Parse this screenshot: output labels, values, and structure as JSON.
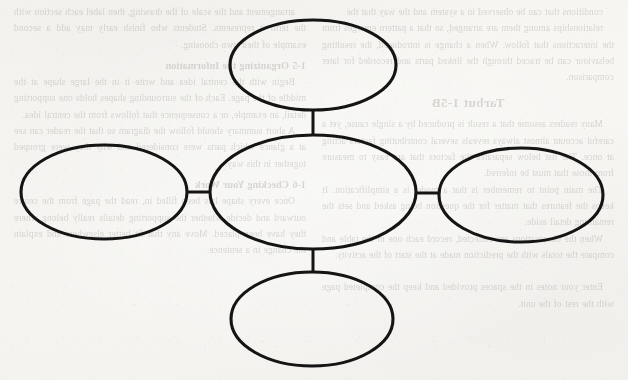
{
  "document": {
    "kind": "worksheet-scan",
    "organizer_type": "bubble-map",
    "page_background": "#f7f6f3",
    "ink_color": "#141414"
  },
  "organizer": {
    "name": "bubble-map-graphic-organizer",
    "center": {
      "id": "center-bubble",
      "label": "",
      "cx": 313,
      "cy": 192,
      "rx": 103,
      "ry": 57
    },
    "satellites": [
      {
        "id": "top-bubble",
        "position": "top",
        "label": "",
        "cx": 313,
        "cy": 65,
        "rx": 83,
        "ry": 45
      },
      {
        "id": "left-bubble",
        "position": "left",
        "label": "",
        "cx": 104,
        "cy": 192,
        "rx": 83,
        "ry": 47
      },
      {
        "id": "right-bubble",
        "position": "right",
        "label": "",
        "cx": 521,
        "cy": 195,
        "rx": 82,
        "ry": 47
      },
      {
        "id": "bottom-bubble",
        "position": "bottom",
        "label": "",
        "cx": 312,
        "cy": 319,
        "rx": 81,
        "ry": 47
      }
    ],
    "connectors": [
      {
        "id": "connector-top",
        "from": "center-bubble",
        "to": "top-bubble",
        "x1": 313,
        "y1": 135,
        "x2": 313,
        "y2": 110
      },
      {
        "id": "connector-left",
        "from": "center-bubble",
        "to": "left-bubble",
        "x1": 210,
        "y1": 192,
        "x2": 187,
        "y2": 192
      },
      {
        "id": "connector-right",
        "from": "center-bubble",
        "to": "right-bubble",
        "x1": 416,
        "y1": 193,
        "x2": 439,
        "y2": 193
      },
      {
        "id": "connector-bottom",
        "from": "center-bubble",
        "to": "bottom-bubble",
        "x1": 313,
        "y1": 249,
        "x2": 313,
        "y2": 272
      }
    ]
  },
  "bleed_through": {
    "note": "faint mirrored text showing through from the reverse side of the page",
    "left_column": {
      "opening": "conditions that can be observed in a system and the way that the",
      "paragraphs": [
        "relationships among them are arranged, so that a pattern emerges from the interactions that follow. When a change is introduced, the resulting behaviour can be traced through the linked parts and recorded for later comparison."
      ],
      "heading": "Tarbut 1-5B",
      "body": [
        "Many readers assume that a result is produced by a single cause, yet a careful account almost always reveals several contributing factors acting at once. The list below separates the factors that are easy to measure from those that must be inferred.",
        "The main point to remember is that a model is a simplification. It keeps the features that matter for the question being asked and sets the remaining detail aside.",
        "When the observations are collected, record each one in the table and compare the totals with the prediction made at the start of the activity."
      ],
      "closing": "Enter your notes in the spaces provided and keep the completed page with the rest of the unit."
    },
    "right_column": {
      "paragraphs": [
        "arrangement and the scale of the drawing, then label each section with the term it represents. Students who finish early may add a second example of their own choosing.",
        "A short summary should follow the diagram so that the reader can see at a glance which parts were considered and why they were grouped together in this way."
      ],
      "subheadings": [
        "1-5 Organizing the Information",
        "1-6 Checking Your Work"
      ],
      "body": [
        "Begin with the central idea and write it in the large shape at the middle of the page. Each of the surrounding shapes holds one supporting detail, an example, or a consequence that follows from the central idea.",
        "Once every shape has been filled in, read the page from the centre outward and decide whether the supporting details really belong where they have been placed. Move any that fit better elsewhere and explain the change in a sentence."
      ]
    }
  }
}
